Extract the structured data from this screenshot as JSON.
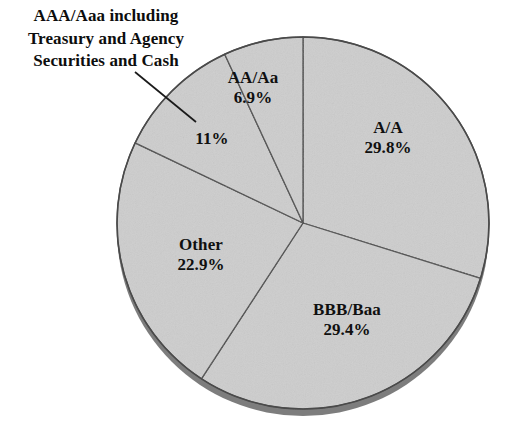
{
  "chart_data": {
    "type": "pie",
    "title": "",
    "subtitle": "",
    "xlabel": "",
    "ylabel": "",
    "legend_position": "none",
    "grid": false,
    "units": "percent",
    "categories": [
      "A/A",
      "BBB/Baa",
      "Other",
      "AAA/Aaa including Treasury and Agency Securities and Cash",
      "AA/Aa"
    ],
    "values": [
      29.8,
      29.4,
      22.9,
      11,
      6.9
    ],
    "slices": [
      {
        "key": "a",
        "name": "A/A",
        "value": 29.8,
        "value_label": "29.8%",
        "start_angle_deg": 0,
        "end_angle_deg": 107.3,
        "fill": "#cdcdcd",
        "label_placement": "inside"
      },
      {
        "key": "bbb",
        "name": "BBB/Baa",
        "value": 29.4,
        "value_label": "29.4%",
        "start_angle_deg": 107.3,
        "end_angle_deg": 213.1,
        "fill": "#cdcdcd",
        "label_placement": "inside"
      },
      {
        "key": "other",
        "name": "Other",
        "value": 22.9,
        "value_label": "22.9%",
        "start_angle_deg": 213.1,
        "end_angle_deg": 295.5,
        "fill": "#cdcdcd",
        "label_placement": "inside"
      },
      {
        "key": "aaa",
        "name": "AAA/Aaa including Treasury and Agency Securities and Cash",
        "value": 11,
        "value_label": "11%",
        "start_angle_deg": 295.5,
        "end_angle_deg": 335.1,
        "fill": "#cdcdcd",
        "label_placement": "callout"
      },
      {
        "key": "aa",
        "name": "AA/Aa",
        "value": 6.9,
        "value_label": "6.9%",
        "start_angle_deg": 335.1,
        "end_angle_deg": 360,
        "fill": "#cdcdcd",
        "label_placement": "inside"
      }
    ],
    "callout": {
      "lines": [
        "AAA/Aaa including",
        "Treasury and Agency",
        "Securities and Cash"
      ],
      "value_label": "11%",
      "leader_line": {
        "x1": 135,
        "y1": 72,
        "x2": 196,
        "y2": 122
      }
    },
    "geometry": {
      "center_x": 303,
      "center_y": 223,
      "radius": 186,
      "depth_px": 7
    },
    "colors": {
      "background": "#ffffff",
      "slice_fill": "#cdcdcd",
      "slice_edge": "#4a4a4a",
      "rim_shadow": "#7d7d7d",
      "text": "#101010"
    }
  },
  "labels": {
    "aa": {
      "name": "AA/Aa",
      "pct": "6.9%"
    },
    "a": {
      "name": "A/A",
      "pct": "29.8%"
    },
    "bbb": {
      "name": "BBB/Baa",
      "pct": "29.4%"
    },
    "other": {
      "name": "Other",
      "pct": "22.9%"
    },
    "aaa": {
      "pct": "11%"
    }
  },
  "callout_lines": {
    "line1": "AAA/Aaa including",
    "line2": "Treasury and Agency",
    "line3": "Securities and Cash"
  }
}
